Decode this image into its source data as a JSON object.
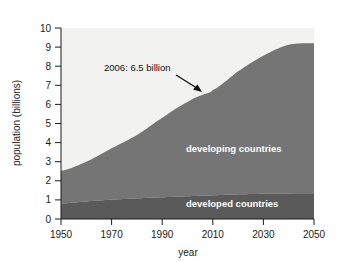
{
  "chart_data": {
    "type": "area",
    "title": "",
    "xlabel": "year",
    "ylabel": "population (billions)",
    "xlim": [
      1950,
      2050
    ],
    "ylim": [
      0,
      10
    ],
    "grid": false,
    "stacked": true,
    "legend_position": "inside-plot",
    "xticks": [
      "1950",
      "1970",
      "1990",
      "2010",
      "2030",
      "2050"
    ],
    "xtick_values": [
      1950,
      1970,
      1990,
      2010,
      2030,
      2050
    ],
    "yticks": [
      "0",
      "1",
      "2",
      "3",
      "4",
      "5",
      "6",
      "7",
      "8",
      "9",
      "10"
    ],
    "ytick_values": [
      0,
      1,
      2,
      3,
      4,
      5,
      6,
      7,
      8,
      9,
      10
    ],
    "x": [
      1950,
      1960,
      1970,
      1980,
      1990,
      2000,
      2006,
      2010,
      2020,
      2030,
      2040,
      2050
    ],
    "series": [
      {
        "name": "developed countries",
        "label": "developed countries",
        "color": "#5a5a5a",
        "values": [
          0.81,
          0.92,
          1.01,
          1.08,
          1.14,
          1.19,
          1.22,
          1.24,
          1.29,
          1.32,
          1.34,
          1.35
        ]
      },
      {
        "name": "developing countries",
        "label": "developing countries",
        "color": "#757575",
        "values": [
          1.71,
          2.08,
          2.69,
          3.32,
          4.16,
          4.93,
          5.28,
          5.51,
          6.44,
          7.23,
          7.78,
          7.85
        ]
      }
    ],
    "totals": [
      2.52,
      3.0,
      3.7,
      4.4,
      5.3,
      6.12,
      6.5,
      6.75,
      7.73,
      8.55,
      9.12,
      9.2
    ],
    "annotations": [
      {
        "text": "2006: 6.5 billion",
        "year": 2006,
        "value": 6.5,
        "arrow": true
      }
    ]
  },
  "plot": {
    "background_color": "#f2f2f0",
    "axis_color": "#1a1a1a"
  }
}
